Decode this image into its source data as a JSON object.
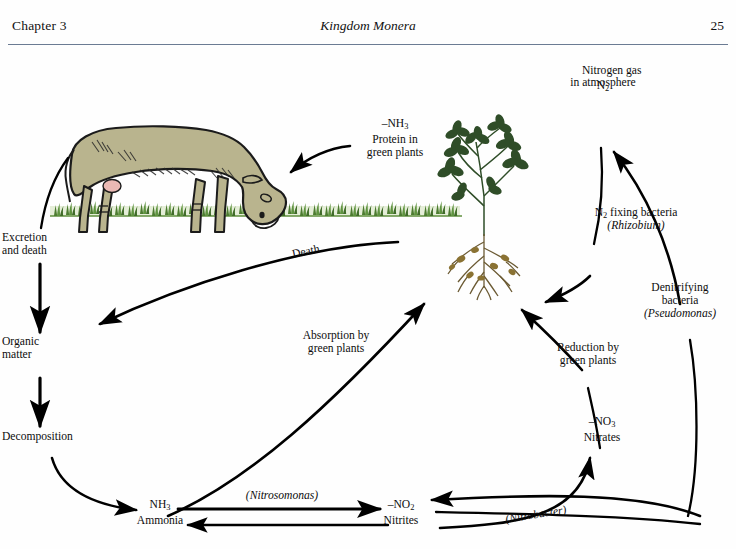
{
  "header": {
    "chapter": "Chapter 3",
    "book_title": "Kingdom Monera",
    "page_number": "25"
  },
  "diagram": {
    "labels": {
      "nitrogen_gas": "Nitrogen gas\nin atmosphere",
      "n2": "N2",
      "protein_plants": "–NH3\nProtein in\ngreen plants",
      "n2_fixing": "N2 fixing bacteria",
      "rhizobium": "(Rhizobium)",
      "denitrifying": "Denitrifying\nbacteria",
      "pseudomonas": "(Pseudomonas)",
      "excretion": "Excretion\nand death",
      "organic_matter": "Organic\nmatter",
      "decomposition": "Decomposition",
      "death": "Death",
      "absorption": "Absorption by\ngreen plants",
      "reduction": "Reduction by\ngreen plants",
      "nitrates": "–NO3\nNitrates",
      "ammonia": "NH3\nAmmonia",
      "nitrites": "–NO2\nNitrites",
      "nitrosomonas": "(Nitrosomonas)",
      "nitrobacter": "(Nitrobacter)"
    },
    "illustrations": {
      "cow": "grazing-cow",
      "plant": "legume-plant-with-root-nodules",
      "grass": "grass-strip"
    },
    "colors": {
      "cow_body": "#b9b48e",
      "cow_outline": "#1a1a1a",
      "udder": "#eab9b4",
      "grass": "#6a9d4a",
      "grass_dark": "#3e6b2a",
      "leaf": "#2f4d28",
      "root": "#6b5a33",
      "nodule": "#8a7233",
      "arrow": "#000000",
      "rule": "#6b7b93"
    }
  }
}
